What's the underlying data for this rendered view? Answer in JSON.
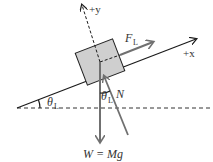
{
  "diagram": {
    "labels": {
      "y_axis": "+y",
      "x_axis": "+x",
      "force_lift": "F",
      "force_lift_sub": "L",
      "normal": "N",
      "angle_incline": "θ",
      "angle_incline_sub": "L",
      "angle_normal": "θ",
      "angle_normal_sub": "L",
      "weight": "W = Mg"
    },
    "colors": {
      "line": "#1a1a1a",
      "force_arrow": "#707070",
      "block_fill": "#cfcfcf",
      "block_stroke": "#222222"
    }
  }
}
